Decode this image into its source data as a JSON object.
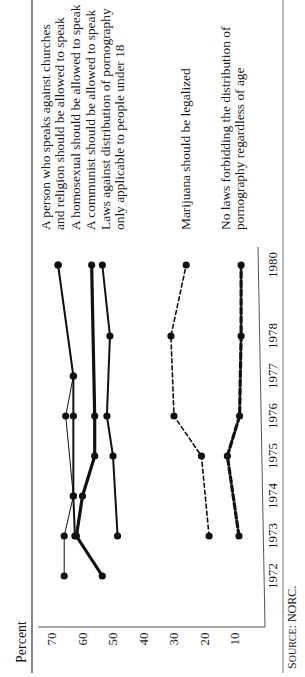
{
  "chart_data": {
    "type": "line",
    "title": "",
    "xlabel": "",
    "ylabel": "Percent",
    "ylim": [
      5,
      72
    ],
    "yticks": [
      70,
      60,
      50,
      40,
      30,
      20,
      10
    ],
    "x": [
      1972,
      1973,
      1974,
      1975,
      1976,
      1977,
      1978,
      1980
    ],
    "xtick_labels": [
      "1972",
      "1973",
      "1974",
      "1975",
      "1976",
      "1977",
      "1978",
      "1980"
    ],
    "grid": false,
    "legend_position": "right, labels beside line ends",
    "orientation": "figure rotated 90 degrees counter-clockwise on page",
    "series": [
      {
        "name": "A person who speaks against churches and religion should be allowed to speak",
        "label_lines": [
          "A person who speaks against churches",
          "and religion should be allowed to speak"
        ],
        "style": "thin solid",
        "points": [
          [
            1972,
            66
          ],
          [
            1973,
            66
          ],
          [
            1974,
            63
          ],
          [
            1976,
            65.5
          ],
          [
            1977,
            63
          ],
          [
            1980,
            68
          ]
        ]
      },
      {
        "name": "A homosexual should be allowed to speak",
        "label_lines": [
          "A homosexual should be allowed to speak"
        ],
        "style": "medium solid",
        "points": [
          [
            1973,
            62.5
          ],
          [
            1974,
            63
          ],
          [
            1976,
            63
          ],
          [
            1977,
            63
          ],
          [
            1980,
            68
          ]
        ]
      },
      {
        "name": "A communist should be allowed to speak",
        "label_lines": [
          "A communist should be allowed to speak"
        ],
        "style": "thick solid",
        "points": [
          [
            1972,
            53.5
          ],
          [
            1973,
            62
          ],
          [
            1974,
            60
          ],
          [
            1975,
            56
          ],
          [
            1976,
            56
          ],
          [
            1980,
            57
          ]
        ]
      },
      {
        "name": "Laws against distribution of pornography only applicable to people under 18",
        "label_lines": [
          "Laws against distribution of pornography",
          "only applicable to people under 18"
        ],
        "style": "medium solid",
        "points": [
          [
            1973,
            48.5
          ],
          [
            1975,
            50
          ],
          [
            1976,
            52
          ],
          [
            1978,
            51
          ],
          [
            1980,
            53.5
          ]
        ]
      },
      {
        "name": "Marijuana should be legalized",
        "label_lines": [
          "Marijuana should be legalized"
        ],
        "style": "thin dashed",
        "points": [
          [
            1973,
            18.5
          ],
          [
            1975,
            21
          ],
          [
            1976,
            30
          ],
          [
            1978,
            31
          ],
          [
            1980,
            26
          ]
        ]
      },
      {
        "name": "No laws forbidding the distribution of pornography regardless of age",
        "label_lines": [
          "No laws forbidding the distribution of",
          "pornography regardless of age"
        ],
        "style": "thick dashed",
        "points": [
          [
            1973,
            8.7
          ],
          [
            1975,
            12.5
          ],
          [
            1976,
            8.5
          ],
          [
            1978,
            8
          ],
          [
            1980,
            8
          ]
        ]
      }
    ],
    "source": "Source: NORC."
  },
  "labels": {
    "y_axis_title": "Percent",
    "source": "Source: NORC."
  }
}
